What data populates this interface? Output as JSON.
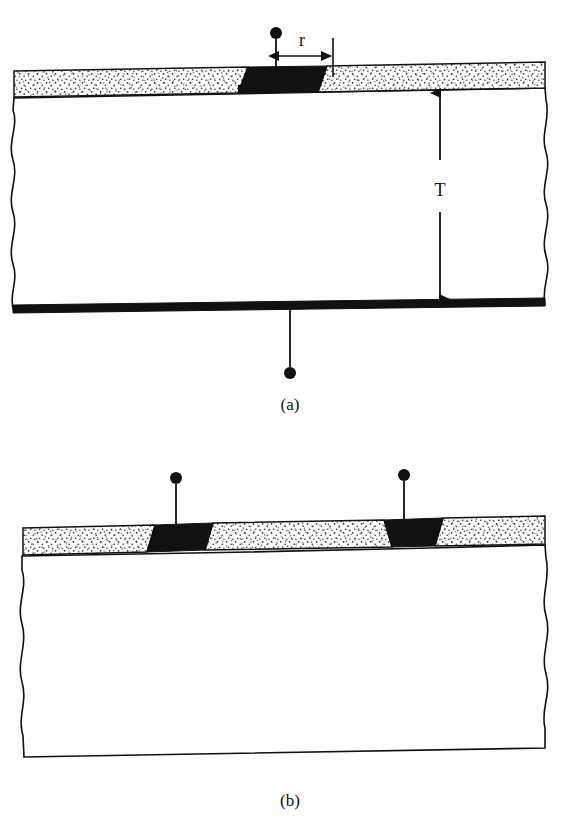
{
  "figure": {
    "title": "",
    "background_color": "#ffffff",
    "ink_color": "#111111",
    "oxide_fill": "#ffffff",
    "metal_fill": "#111111",
    "substrate_fill": "#ffffff",
    "width_px": 583,
    "height_px": 821
  },
  "panels": [
    {
      "id": "a",
      "caption": "(a)",
      "caption_x": 290,
      "caption_y": 410,
      "description": "Vertical structure: single front contact through oxide window, full-area back contact",
      "dimension_labels": [
        {
          "name": "contact-radius",
          "text": "r",
          "x": 302,
          "y": 46
        },
        {
          "name": "substrate-thickness",
          "text": "T",
          "x": 440,
          "y": 196
        }
      ],
      "terminals": [
        {
          "name": "top-terminal-dot",
          "cx": 276,
          "cy": 33,
          "r": 6
        },
        {
          "name": "bottom-terminal-dot",
          "cx": 290,
          "cy": 373,
          "r": 6
        }
      ]
    },
    {
      "id": "b",
      "caption": "(b)",
      "caption_x": 290,
      "caption_y": 806,
      "description": "Lateral structure: two coplanar front contacts through oxide windows, no back contact",
      "dimension_labels": [],
      "terminals": [
        {
          "name": "left-terminal-dot",
          "cx": 176,
          "cy": 478,
          "r": 6
        },
        {
          "name": "right-terminal-dot",
          "cx": 404,
          "cy": 475,
          "r": 6
        }
      ]
    }
  ],
  "legend_semantics": {
    "stippled_layer": "oxide / insulating film",
    "solid_black_layer": "metal contact",
    "blank_region": "semiconductor substrate",
    "wavy_edge": "break line (structure continues)"
  }
}
